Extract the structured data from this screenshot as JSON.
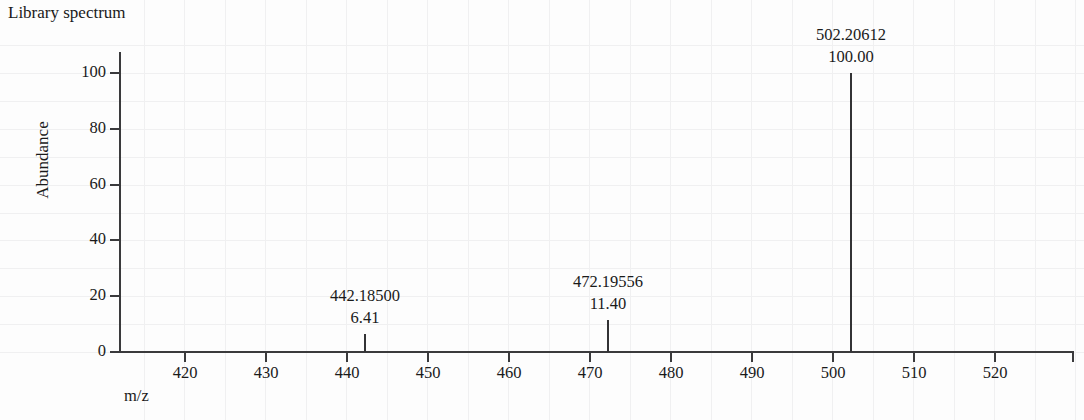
{
  "chart_data": {
    "type": "bar",
    "title": "Library spectrum",
    "xlabel": "m/z",
    "ylabel": "Abundance",
    "xlim": [
      412,
      530
    ],
    "ylim": [
      0,
      108
    ],
    "xticks": [
      420,
      430,
      440,
      450,
      460,
      470,
      480,
      490,
      500,
      510,
      520
    ],
    "yticks": [
      0,
      20,
      40,
      60,
      80,
      100
    ],
    "grid": "faint",
    "legend": "none",
    "x": [
      442.185,
      472.19556,
      502.20612
    ],
    "values": [
      6.41,
      11.4,
      100.0
    ],
    "labels": [
      {
        "mz": "442.18500",
        "abundance": "6.41"
      },
      {
        "mz": "472.19556",
        "abundance": "11.40"
      },
      {
        "mz": "502.20612",
        "abundance": "100.00"
      }
    ],
    "annotations": [
      "442.18500 / 6.41",
      "472.19556 / 11.40",
      "502.20612 / 100.00"
    ]
  },
  "axis": {
    "y_tick_labels": [
      "100",
      "80",
      "60",
      "40",
      "20",
      "0"
    ],
    "x_tick_labels": [
      "420",
      "430",
      "440",
      "450",
      "460",
      "470",
      "480",
      "490",
      "500",
      "510",
      "520"
    ]
  },
  "colors": {
    "axis": "#3a3a3c",
    "peak": "#333335",
    "text": "#1a1a1a",
    "background": "#fdfdfd",
    "gridline": "#f0f0f1"
  }
}
